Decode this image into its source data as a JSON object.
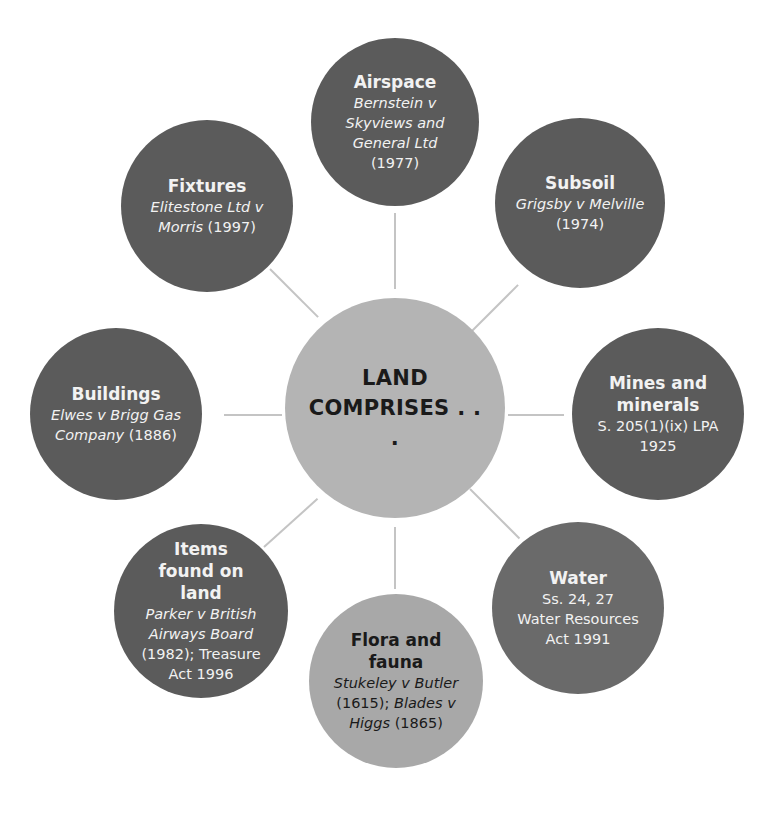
{
  "diagram": {
    "center": {
      "title_line1": "LAND",
      "title_line2": "COMPRISES . . ."
    },
    "nodes": [
      {
        "id": "airspace",
        "title": "Airspace",
        "body": [
          {
            "text": "Bernstein v",
            "italic": true
          },
          {
            "text": "Skyviews and",
            "italic": true
          },
          {
            "text": "General Ltd",
            "italic": true
          },
          {
            "text": "(1977)",
            "italic": false
          }
        ]
      },
      {
        "id": "subsoil",
        "title": "Subsoil",
        "body": [
          {
            "text": "Grigsby v Melville",
            "italic": true
          },
          {
            "text": "(1974)",
            "italic": false
          }
        ]
      },
      {
        "id": "mines",
        "title": "Mines and minerals",
        "body": [
          {
            "text": "S. 205(1)(ix) LPA",
            "italic": false
          },
          {
            "text": "1925",
            "italic": false
          }
        ]
      },
      {
        "id": "water",
        "title": "Water",
        "body": [
          {
            "text": "Ss. 24, 27",
            "italic": false
          },
          {
            "text": "Water Resources",
            "italic": false
          },
          {
            "text": "Act 1991",
            "italic": false
          }
        ]
      },
      {
        "id": "flora",
        "title": "Flora and fauna",
        "body": [
          {
            "text": "Stukeley v Butler",
            "italic": true
          },
          {
            "text": "(1615); ",
            "italic": false,
            "join": "Blades v",
            "join_italic": true
          },
          {
            "text": "Higgs",
            "italic": true,
            "join": " (1865)",
            "join_italic": false
          }
        ]
      },
      {
        "id": "items",
        "title": "Items found on land",
        "body": [
          {
            "text": "Parker v British",
            "italic": true
          },
          {
            "text": "Airways Board",
            "italic": true
          },
          {
            "text": "(1982); Treasure",
            "italic": false
          },
          {
            "text": "Act 1996",
            "italic": false
          }
        ]
      },
      {
        "id": "buildings",
        "title": "Buildings",
        "body": [
          {
            "text": "Elwes v Brigg Gas",
            "italic": true
          },
          {
            "text": "Company",
            "italic": true,
            "join": " (1886)",
            "join_italic": false
          }
        ]
      },
      {
        "id": "fixtures",
        "title": "Fixtures",
        "body": [
          {
            "text": "Elitestone Ltd v",
            "italic": true
          },
          {
            "text": "Morris",
            "italic": true,
            "join": " (1997)",
            "join_italic": false
          }
        ]
      }
    ],
    "colors": {
      "dark": "#5b5b5b",
      "mid": "#6a6a6a",
      "light": "#a8a8a8",
      "center": "#b4b4b4",
      "connector": "#c4c4c4"
    }
  }
}
